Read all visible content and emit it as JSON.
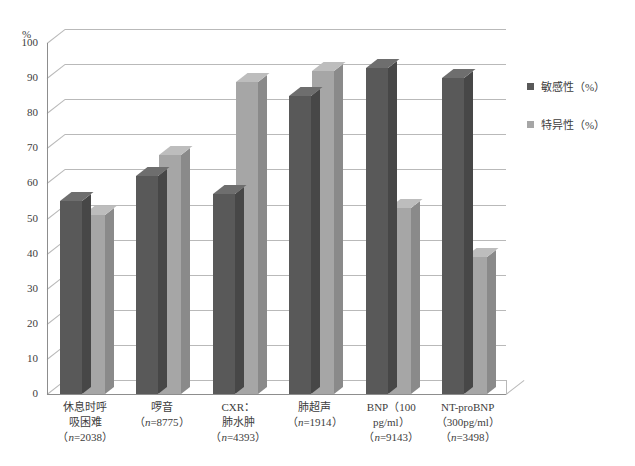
{
  "chart_data": {
    "type": "bar",
    "title": "",
    "xlabel": "",
    "ylabel": "%",
    "ylim": [
      0,
      100
    ],
    "ytick_step": 10,
    "yticks": [
      "100",
      "90",
      "80",
      "70",
      "60",
      "50",
      "40",
      "30",
      "20",
      "10",
      "0"
    ],
    "grid": true,
    "legend_position": "right",
    "categories": [
      "休息时呼吸困难（n=2038）",
      "啰音（n=8775）",
      "CXR：肺水肿（n=4393）",
      "肺超声（n=1914）",
      "BNP（100 pg/ml）（n=9143）",
      "NT-proBNP（300pg/ml）（n=3498）"
    ],
    "category_lines": [
      [
        "休息时呼",
        "吸困难",
        "（n=2038）"
      ],
      [
        "啰音",
        "（n=8775）"
      ],
      [
        "CXR：",
        "肺水肿",
        "（n=4393）"
      ],
      [
        "肺超声",
        "（n=1914）"
      ],
      [
        "BNP（100",
        "pg/ml）",
        "（n=9143）"
      ],
      [
        "NT-proBNP",
        "（300pg/ml）",
        "（n=3498）"
      ]
    ],
    "series": [
      {
        "name": "敏感性（%）",
        "color": "#595959",
        "values": [
          55,
          62,
          57,
          85,
          93,
          90
        ]
      },
      {
        "name": "特异性（%）",
        "color": "#a6a6a6",
        "values": [
          51,
          68,
          89,
          92,
          53,
          39
        ]
      }
    ]
  },
  "legend": {
    "items": [
      {
        "label": "敏感性（%）",
        "color": "#595959"
      },
      {
        "label": "特异性（%）",
        "color": "#a6a6a6"
      }
    ]
  }
}
